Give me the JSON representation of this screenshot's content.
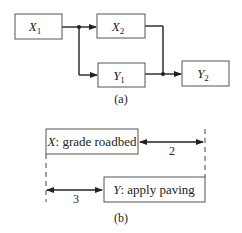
{
  "diagram_a": {
    "caption": "(a)",
    "nodes": [
      {
        "id": "X1",
        "base": "X",
        "sub": "1"
      },
      {
        "id": "X2",
        "base": "X",
        "sub": "2"
      },
      {
        "id": "Y1",
        "base": "Y",
        "sub": "1"
      },
      {
        "id": "Y2",
        "base": "Y",
        "sub": "2"
      }
    ],
    "edges": [
      {
        "from": "X1",
        "to": "X2"
      },
      {
        "from": "X1",
        "to": "Y1"
      },
      {
        "from": "X2",
        "to": "Y2"
      },
      {
        "from": "Y1",
        "to": "Y2"
      }
    ]
  },
  "diagram_b": {
    "caption": "(b)",
    "activity_x": {
      "letter": "X",
      "rest": ": grade roadbed"
    },
    "activity_y": {
      "letter": "Y",
      "rest": ": apply paving"
    },
    "lag_finish": "2",
    "lag_start": "3"
  }
}
